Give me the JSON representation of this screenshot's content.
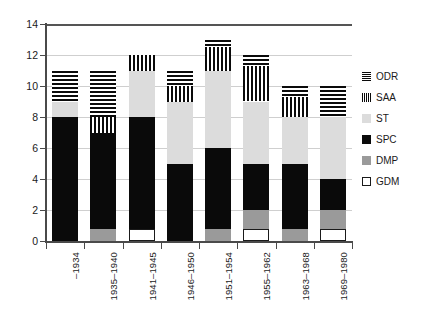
{
  "chart_data": {
    "type": "bar",
    "stacked": true,
    "title": "",
    "subtitle": "",
    "xlabel": "",
    "ylabel": "",
    "ylim": [
      0,
      14
    ],
    "yticks": [
      0,
      2,
      4,
      6,
      8,
      10,
      12,
      14
    ],
    "ytick_labels": [
      "0",
      "2",
      "4",
      "6",
      "8",
      "10",
      "12",
      "14"
    ],
    "grid": true,
    "grid_axis": "y",
    "legend_position": "right",
    "categories": [
      "–1934",
      "1935–1940",
      "1941–1945",
      "1946–1950",
      "1951–1954",
      "1955–1962",
      "1963–1968",
      "1969–1980"
    ],
    "series": [
      {
        "name": "GDM",
        "color": "#ffffff",
        "pattern": "solid-outline",
        "values": [
          0,
          0,
          0.8,
          0,
          0,
          0.8,
          0,
          0.8
        ]
      },
      {
        "name": "DMP",
        "color": "#9a9a9a",
        "pattern": "solid",
        "values": [
          0,
          0.8,
          0,
          0,
          0.8,
          1.2,
          0.8,
          1.2
        ]
      },
      {
        "name": "SPC",
        "color": "#0a0a0a",
        "pattern": "solid",
        "values": [
          8,
          6.2,
          7.2,
          5,
          5.2,
          3,
          4.2,
          2
        ]
      },
      {
        "name": "ST",
        "color": "#dcdcdc",
        "pattern": "solid",
        "values": [
          1,
          0,
          3,
          4,
          5,
          4,
          3,
          4
        ]
      },
      {
        "name": "SAA",
        "color": "#0a0a0a",
        "pattern": "vertical-stripes",
        "values": [
          0,
          1,
          1,
          1,
          1.5,
          2.3,
          1.3,
          0
        ]
      },
      {
        "name": "ODR",
        "color": "#0a0a0a",
        "pattern": "horizontal-stripes",
        "values": [
          2,
          3,
          0,
          1,
          0.5,
          0.7,
          0.7,
          2
        ]
      }
    ],
    "totals": [
      11,
      11,
      12,
      11,
      13,
      12,
      10,
      10
    ]
  },
  "legend": {
    "items": [
      {
        "label": "ODR",
        "swatch": "horizontal-stripes-swatch"
      },
      {
        "label": "SAA",
        "swatch": "vertical-stripes-swatch"
      },
      {
        "label": "ST",
        "swatch": "light-gray-swatch"
      },
      {
        "label": "SPC",
        "swatch": "black-swatch"
      },
      {
        "label": "DMP",
        "swatch": "medium-gray-swatch"
      },
      {
        "label": "GDM",
        "swatch": "white-swatch"
      }
    ]
  },
  "colors": {
    "GDM": "#ffffff",
    "DMP": "#9a9a9a",
    "SPC": "#0a0a0a",
    "ST": "#dcdcdc",
    "SAA": "#0a0a0a",
    "ODR": "#0a0a0a",
    "axis": "#4a4a4a",
    "grid": "#cfcfcf",
    "text": "#1a1a1a",
    "background": "#ffffff"
  }
}
